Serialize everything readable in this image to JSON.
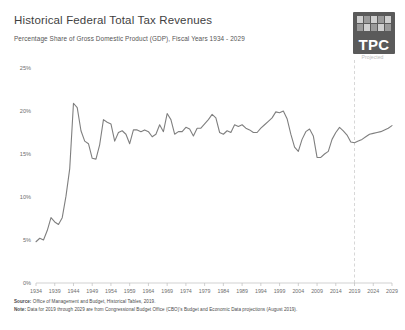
{
  "header": {
    "title": "Historical Federal Total Tax Revenues",
    "subtitle": "Percentage Share of Gross Domestic Product (GDP), Fiscal Years 1934 - 2029"
  },
  "logo": {
    "text": "TPC",
    "alt": "Tax Policy Center logo"
  },
  "annotations": {
    "projected_label": "Projected",
    "projection_start_year": 2019
  },
  "footnotes": {
    "source_label": "Source:",
    "source_text": "Office of Management and Budget, Historical Tables, 2019.",
    "note_label": "Note:",
    "note_text": "Data for 2019 through 2029 are from Congressional Budget Office (CBO)'s Budget and Economic Data projections (August 2019)."
  },
  "colors": {
    "line": "#7f7f7f",
    "axis": "#bdbdbd",
    "tick_text": "#6e6e6e",
    "projection_rule": "#cccccc",
    "logo_bg": "#5a5a5a",
    "title_text": "#3f3f3f"
  },
  "chart_data": {
    "type": "line",
    "title": "Historical Federal Total Tax Revenues",
    "subtitle": "Percentage Share of Gross Domestic Product (GDP), Fiscal Years 1934 - 2029",
    "xlabel": "",
    "ylabel": "",
    "ylim": [
      0,
      25
    ],
    "yticks": [
      0,
      5,
      10,
      15,
      20,
      25
    ],
    "ytick_labels": [
      "0%",
      "5%",
      "10%",
      "15%",
      "20%",
      "25%"
    ],
    "xlim": [
      1934,
      2029
    ],
    "xticks": [
      1934,
      1939,
      1944,
      1949,
      1954,
      1959,
      1964,
      1969,
      1974,
      1979,
      1984,
      1989,
      1994,
      1999,
      2004,
      2009,
      2014,
      2019,
      2024,
      2029
    ],
    "xtick_labels": [
      "1934",
      "1939",
      "1944",
      "1949",
      "1954",
      "1959",
      "1964",
      "1969",
      "1974",
      "1979",
      "1984",
      "1989",
      "1994",
      "1999",
      "2004",
      "2009",
      "2014",
      "2019",
      "2024",
      "2029"
    ],
    "grid": false,
    "legend": null,
    "series": [
      {
        "name": "Total tax revenues as share of GDP",
        "x": [
          1934,
          1935,
          1936,
          1937,
          1938,
          1939,
          1940,
          1941,
          1942,
          1943,
          1944,
          1945,
          1946,
          1947,
          1948,
          1949,
          1950,
          1951,
          1952,
          1953,
          1954,
          1955,
          1956,
          1957,
          1958,
          1959,
          1960,
          1961,
          1962,
          1963,
          1964,
          1965,
          1966,
          1967,
          1968,
          1969,
          1970,
          1971,
          1972,
          1973,
          1974,
          1975,
          1976,
          1977,
          1978,
          1979,
          1980,
          1981,
          1982,
          1983,
          1984,
          1985,
          1986,
          1987,
          1988,
          1989,
          1990,
          1991,
          1992,
          1993,
          1994,
          1995,
          1996,
          1997,
          1998,
          1999,
          2000,
          2001,
          2002,
          2003,
          2004,
          2005,
          2006,
          2007,
          2008,
          2009,
          2010,
          2011,
          2012,
          2013,
          2014,
          2015,
          2016,
          2017,
          2018,
          2019,
          2020,
          2021,
          2022,
          2023,
          2024,
          2025,
          2026,
          2027,
          2028,
          2029
        ],
        "y": [
          4.8,
          5.2,
          5.0,
          6.1,
          7.6,
          7.1,
          6.8,
          7.6,
          10.1,
          13.3,
          20.9,
          20.4,
          17.7,
          16.5,
          16.2,
          14.5,
          14.4,
          16.1,
          19.0,
          18.7,
          18.5,
          16.5,
          17.5,
          17.7,
          17.3,
          16.2,
          17.8,
          17.8,
          17.6,
          17.8,
          17.6,
          17.0,
          17.3,
          18.4,
          17.6,
          19.7,
          19.0,
          17.3,
          17.6,
          17.6,
          18.1,
          17.9,
          17.1,
          18.0,
          18.0,
          18.5,
          19.0,
          19.6,
          19.2,
          17.5,
          17.3,
          17.7,
          17.5,
          18.4,
          18.2,
          18.4,
          18.0,
          17.8,
          17.5,
          17.5,
          18.0,
          18.4,
          18.8,
          19.2,
          19.9,
          19.8,
          20.0,
          19.1,
          17.3,
          15.8,
          15.3,
          16.7,
          17.6,
          17.9,
          17.1,
          14.6,
          14.6,
          15.0,
          15.3,
          16.7,
          17.5,
          18.1,
          17.7,
          17.2,
          16.4,
          16.3,
          16.5,
          16.7,
          17.0,
          17.3,
          17.4,
          17.5,
          17.6,
          17.8,
          18.0,
          18.3
        ]
      }
    ],
    "projection_note": "Values from 2019 onward are CBO projections (right of dashed vertical rule)."
  }
}
